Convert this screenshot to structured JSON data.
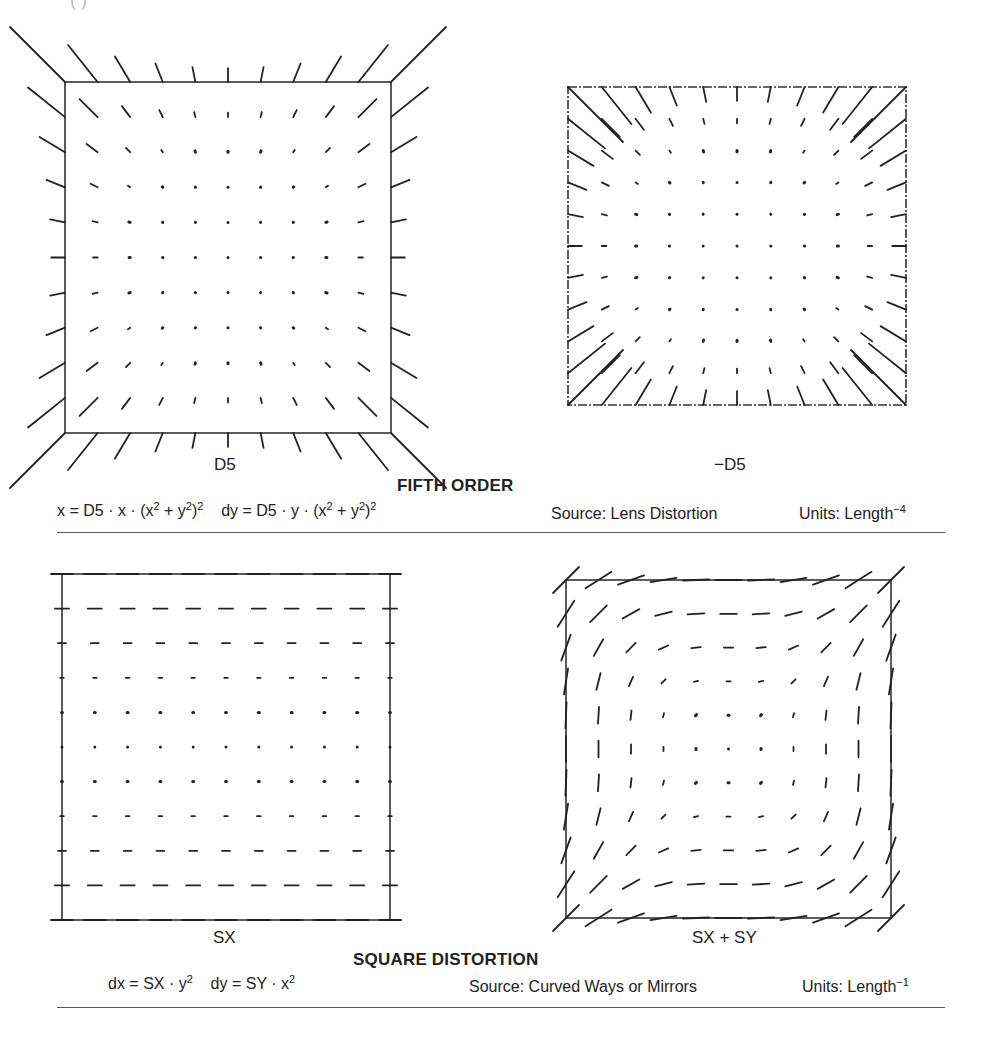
{
  "header": {
    "clipped_text": "(          )"
  },
  "sections": [
    {
      "title": "FIFTH ORDER",
      "formula": {
        "dx_prefix": "x = D5 · x · (x",
        "dx_mid": " + y",
        "dx_end": ")",
        "dy_prefix": "dy = D5 · y · (x",
        "dy_mid": " + y",
        "dy_end": ")",
        "sq": "2"
      },
      "source": "Source: Lens Distortion",
      "units_label": "Units: Length",
      "units_exp": "−4",
      "plots": [
        {
          "label": "D5",
          "type": "radial5",
          "coef": 1
        },
        {
          "label": "−D5",
          "type": "radial5",
          "coef": -1
        }
      ]
    },
    {
      "title": "SQUARE DISTORTION",
      "formula": {
        "dx_prefix": "dx = SX · y",
        "dy_prefix": "dy = SY · x",
        "sq": "2"
      },
      "source": "Source: Curved Ways or Mirrors",
      "units_label": "Units: Length",
      "units_exp": "−1",
      "plots": [
        {
          "label": "SX",
          "type": "square",
          "sx": 1,
          "sy": 0
        },
        {
          "label": "SX + SY",
          "type": "square",
          "sx": 1,
          "sy": 1
        }
      ]
    }
  ],
  "chart_data": [
    {
      "type": "vector-field",
      "title": "FIFTH ORDER — D5",
      "grid": "11x11, x,y in [-1,1]",
      "equation": "dx = D5·x·(x²+y²)², dy = D5·y·(x²+y²)²",
      "coefficient": 1,
      "description": "Vectors point outward (pincushion-like), magnitude grows with r^5; frame corners pulled outward."
    },
    {
      "type": "vector-field",
      "title": "FIFTH ORDER — −D5",
      "grid": "11x11, x,y in [-1,1]",
      "equation": "dx = D5·x·(x²+y²)², dy = D5·y·(x²+y²)²",
      "coefficient": -1,
      "description": "Vectors point inward (barrel-like), large at corners."
    },
    {
      "type": "vector-field",
      "title": "SQUARE DISTORTION — SX",
      "grid": "11x11, x,y in [-1,1]",
      "equation": "dx = SX·y², dy = 0",
      "description": "Horizontal vectors proportional to y², longest on top and bottom rows."
    },
    {
      "type": "vector-field",
      "title": "SQUARE DISTORTION — SX + SY",
      "grid": "11x11, x,y in [-1,1]",
      "equation": "dx = SX·y², dy = SY·x²",
      "description": "Vectors form a swirl-like square pattern, horizontal at top/bottom, vertical at left/right, diagonal at corners."
    }
  ]
}
